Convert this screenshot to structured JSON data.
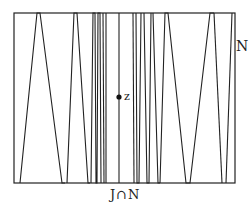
{
  "diagram": {
    "labels": {
      "set_n": "N",
      "point_z": "z",
      "intersection": "J∩N"
    },
    "box": {
      "x1": 14,
      "y1": 13,
      "x2": 235,
      "y2": 183
    },
    "point_z": {
      "x": 119,
      "y": 97
    },
    "zigzag_vertices_x": [
      [
        20,
        "bottom"
      ],
      [
        38,
        "top"
      ],
      [
        63,
        "bottom"
      ],
      [
        67,
        "bottom"
      ],
      [
        76,
        "top"
      ],
      [
        89,
        "bottom"
      ],
      [
        93,
        "top"
      ],
      [
        95,
        "bottom"
      ],
      [
        97,
        "top"
      ],
      [
        100,
        "bottom"
      ],
      [
        103,
        "top"
      ],
      [
        104,
        "bottom"
      ],
      [
        119,
        "top"
      ],
      [
        119,
        "bottom"
      ],
      [
        133,
        "top"
      ],
      [
        134,
        "bottom"
      ],
      [
        136,
        "top"
      ],
      [
        139,
        "bottom"
      ],
      [
        141,
        "top"
      ],
      [
        145,
        "bottom"
      ],
      [
        149,
        "top"
      ],
      [
        161,
        "bottom"
      ],
      [
        164,
        "top"
      ],
      [
        173,
        "bottom"
      ],
      [
        174,
        "top"
      ],
      [
        195,
        "bottom"
      ],
      [
        201,
        "bottom"
      ],
      [
        220,
        "top"
      ],
      [
        222,
        "top"
      ]
    ],
    "colors": {
      "stroke": "#222222",
      "background": "#ffffff"
    }
  }
}
